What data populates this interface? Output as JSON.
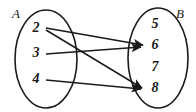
{
  "diagram": {
    "type": "mapping-diagram",
    "background_color": "#ffffff",
    "stroke_color": "#1a1a1a",
    "sets": [
      {
        "id": "A",
        "label": "A",
        "label_position": "top-left-outside",
        "side": "left",
        "shape": "ellipse",
        "cx": 46,
        "cy": 59,
        "rx": 31,
        "ry": 49,
        "elements": [
          {
            "value": "2",
            "x": 36,
            "y": 29
          },
          {
            "value": "3",
            "x": 36,
            "y": 54
          },
          {
            "value": "4",
            "x": 36,
            "y": 80
          }
        ]
      },
      {
        "id": "B",
        "label": "B",
        "label_position": "top-right-outside",
        "side": "right",
        "shape": "ellipse",
        "cx": 158,
        "cy": 58,
        "rx": 30,
        "ry": 50,
        "elements": [
          {
            "value": "5",
            "x": 155,
            "y": 25
          },
          {
            "value": "6",
            "x": 155,
            "y": 46
          },
          {
            "value": "7",
            "x": 155,
            "y": 68
          },
          {
            "value": "8",
            "x": 155,
            "y": 89
          }
        ]
      }
    ],
    "set_label_A": {
      "text": "A",
      "x": 12,
      "y": 18
    },
    "set_label_B": {
      "text": "B",
      "x": 176,
      "y": 18
    },
    "arrows": [
      {
        "id": "arrow-2-to-6",
        "from": "2",
        "to": "6",
        "x1": 46,
        "y1": 28,
        "x2": 143,
        "y2": 45
      },
      {
        "id": "arrow-2-to-8",
        "from": "2",
        "to": "8",
        "x1": 46,
        "y1": 30,
        "x2": 142,
        "y2": 88
      },
      {
        "id": "arrow-3-to-6",
        "from": "3",
        "to": "6",
        "x1": 46,
        "y1": 54,
        "x2": 141,
        "y2": 47
      },
      {
        "id": "arrow-4-to-8",
        "from": "4",
        "to": "8",
        "x1": 46,
        "y1": 80,
        "x2": 141,
        "y2": 89
      }
    ]
  }
}
